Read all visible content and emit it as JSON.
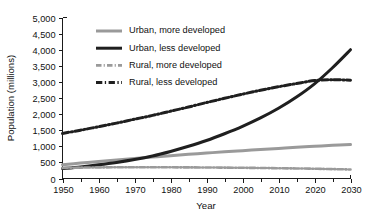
{
  "chart_data": {
    "type": "line",
    "title": "",
    "xlabel": "Year",
    "ylabel": "Population (millions)",
    "xlim": [
      1950,
      2030
    ],
    "ylim": [
      0,
      5000
    ],
    "grid": false,
    "legend_position": "upper-left-inside",
    "x_tick_labels": [
      "1950",
      "1960",
      "1970",
      "1980",
      "1990",
      "2000",
      "2010",
      "2020",
      "2030"
    ],
    "x_ticks": [
      1950,
      1960,
      1970,
      1980,
      1990,
      2000,
      2010,
      2020,
      2030
    ],
    "x_minor_ticks": [
      1955,
      1965,
      1975,
      1985,
      1995,
      2005,
      2015,
      2025
    ],
    "y_tick_labels": [
      "0",
      "500",
      "1,000",
      "1,500",
      "2,000",
      "2,500",
      "3,000",
      "3,500",
      "4,000",
      "4,500",
      "5,000"
    ],
    "y_ticks": [
      0,
      500,
      1000,
      1500,
      2000,
      2500,
      3000,
      3500,
      4000,
      4500,
      5000
    ],
    "x": [
      1950,
      1955,
      1960,
      1965,
      1970,
      1975,
      1980,
      1985,
      1990,
      1995,
      2000,
      2005,
      2010,
      2015,
      2020,
      2025,
      2030
    ],
    "series": [
      {
        "name": "Urban, more developed",
        "color": "#9a9a9a",
        "style": "solid",
        "width": 3.0,
        "values": [
          430,
          480,
          530,
          575,
          620,
          665,
          710,
          750,
          790,
          830,
          865,
          900,
          935,
          970,
          1000,
          1030,
          1055
        ]
      },
      {
        "name": "Urban, less developed",
        "color": "#1f1f1f",
        "style": "solid",
        "width": 3.0,
        "values": [
          310,
          360,
          425,
          500,
          590,
          700,
          840,
          1000,
          1180,
          1390,
          1620,
          1880,
          2180,
          2530,
          2940,
          3440,
          4000
        ]
      },
      {
        "name": "Rural, more developed",
        "color": "#9a9a9a",
        "style": "dashdot",
        "width": 2.6,
        "values": [
          330,
          338,
          344,
          348,
          350,
          350,
          348,
          345,
          342,
          338,
          333,
          327,
          320,
          312,
          303,
          292,
          280
        ]
      },
      {
        "name": "Rural, less developed",
        "color": "#1f1f1f",
        "style": "dashdot",
        "width": 3.0,
        "values": [
          1400,
          1500,
          1610,
          1720,
          1840,
          1960,
          2090,
          2220,
          2360,
          2490,
          2620,
          2740,
          2850,
          2950,
          3040,
          3070,
          3050
        ]
      }
    ],
    "legend_entries": [
      {
        "label": "Urban, more developed",
        "color": "#9a9a9a",
        "style": "solid"
      },
      {
        "label": "Urban, less developed",
        "color": "#1f1f1f",
        "style": "solid"
      },
      {
        "label": "Rural, more developed",
        "color": "#9a9a9a",
        "style": "dashdot"
      },
      {
        "label": "Rural, less developed",
        "color": "#1f1f1f",
        "style": "dashdot"
      }
    ],
    "colors": {
      "more_developed": "#9a9a9a",
      "less_developed": "#1f1f1f",
      "axis": "#1a1a1a",
      "background": "#ffffff"
    }
  }
}
